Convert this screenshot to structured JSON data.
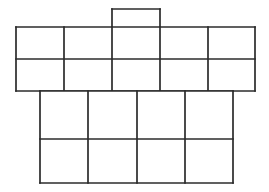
{
  "figure": {
    "name": "cube-net-grid-diagram",
    "background_color": "#ffffff",
    "line_color": "#2b2b2b",
    "line_width": 1.7,
    "canvas": {
      "width": 269,
      "height": 192
    }
  },
  "chart_data": {
    "type": "diagram",
    "grid_color": "#2b2b2b",
    "background": "#ffffff",
    "bands": [
      {
        "name": "tab",
        "label": "top-tab",
        "columns": 1,
        "rows": 1,
        "x_edges": [
          112,
          160
        ],
        "y_edges": [
          9,
          27
        ],
        "cell_count": 1
      },
      {
        "name": "upper-band",
        "label": "upper-band",
        "columns": 5,
        "rows": 2,
        "x_edges": [
          16,
          64,
          112,
          160,
          208,
          255
        ],
        "y_edges": [
          27,
          59,
          91
        ],
        "cell_count": 10
      },
      {
        "name": "lower-band",
        "label": "lower-band",
        "columns": 4,
        "rows": 2,
        "x_edges": [
          40,
          88,
          137,
          185,
          233
        ],
        "y_edges": [
          91,
          139,
          183
        ],
        "cell_count": 8
      }
    ],
    "totals": {
      "cells": 19,
      "tab_cells": 1,
      "upper_cells": 10,
      "lower_cells": 8
    }
  }
}
